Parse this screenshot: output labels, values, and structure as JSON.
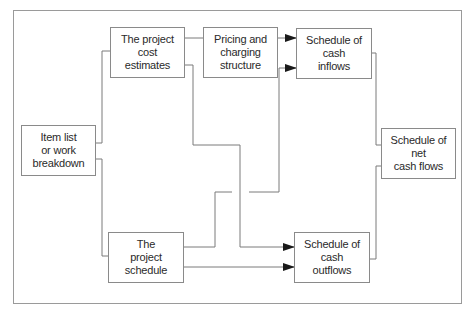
{
  "diagram": {
    "nodes": {
      "item_list": "Item list\nor work\nbreakdown",
      "cost_estimates": "The project\ncost\nestimates",
      "pricing": "Pricing and\ncharging\nstructure",
      "cash_inflows": "Schedule of\ncash\ninflows",
      "project_schedule": "The\nproject\nschedule",
      "cash_outflows": "Schedule of\ncash\noutflows",
      "net_cash_flows": "Schedule of\nnet\ncash flows"
    },
    "edges": [
      {
        "from": "item_list",
        "to": "cost_estimates"
      },
      {
        "from": "item_list",
        "to": "project_schedule"
      },
      {
        "from": "cost_estimates",
        "to": "pricing"
      },
      {
        "from": "pricing",
        "to": "cash_inflows",
        "arrow": true
      },
      {
        "from": "project_schedule",
        "to": "cash_inflows",
        "arrow": true
      },
      {
        "from": "cost_estimates",
        "to": "cash_outflows",
        "arrow": true
      },
      {
        "from": "project_schedule",
        "to": "cash_outflows",
        "arrow": true
      },
      {
        "from": "cash_inflows",
        "to": "net_cash_flows"
      },
      {
        "from": "cash_outflows",
        "to": "net_cash_flows"
      }
    ],
    "colors": {
      "line": "#7a7a7a",
      "border": "#8a8a8a",
      "text": "#2a2a2a",
      "arrow": "#1a1a1a"
    }
  }
}
